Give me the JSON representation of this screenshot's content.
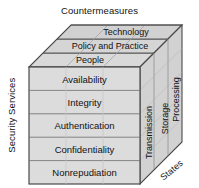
{
  "diagram": {
    "name": "McCumber Cube information security model",
    "type": "3d-cube",
    "axes": {
      "top_title": "Countermeasures",
      "left_title": "Security Services",
      "bottom_right_title": "States"
    },
    "countermeasures": [
      {
        "label": "Technology"
      },
      {
        "label": "Policy and Practice"
      },
      {
        "label": "People"
      }
    ],
    "security_services": [
      {
        "label": "Availability"
      },
      {
        "label": "Integrity"
      },
      {
        "label": "Authentication"
      },
      {
        "label": "Confidentiality"
      },
      {
        "label": "Nonrepudiation"
      }
    ],
    "states": [
      {
        "label": "Transmission"
      },
      {
        "label": "Storage"
      },
      {
        "label": "Processing"
      }
    ],
    "colors": {
      "front_face": "#dcdcdc",
      "top_face": "#d6d6d6",
      "side_face": "#d2d2d2",
      "outline": "#4a4a4a",
      "inner_line": "#9a9a9a",
      "text": "#111111",
      "background": "#ffffff"
    }
  }
}
